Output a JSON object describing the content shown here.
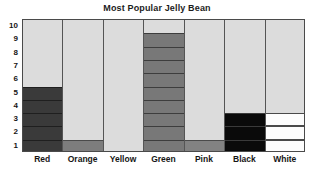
{
  "chart_data": {
    "type": "bar",
    "title": "Most Popular Jelly Bean",
    "xlabel": "",
    "ylabel": "",
    "categories": [
      "Red",
      "Orange",
      "Yellow",
      "Green",
      "Pink",
      "Black",
      "White"
    ],
    "values": [
      5,
      1,
      0,
      9,
      1,
      3,
      3
    ],
    "ylim": [
      0,
      10
    ],
    "yticks": [
      10,
      9,
      8,
      7,
      6,
      5,
      4,
      3,
      2,
      1
    ],
    "ytick_labels": [
      "10",
      "9",
      "8",
      "7",
      "6",
      "5",
      "4",
      "3",
      "2",
      "1"
    ],
    "grid": true,
    "legend": "none",
    "bar_style": "segmented-unit-cells",
    "series_colors": [
      "#3a3a3a",
      "#7d7d7d",
      "#dcdcdc",
      "#787878",
      "#828282",
      "#0a0a0a",
      "#fdfdfd"
    ],
    "plot_background": "#dcdcdc",
    "frame_color": "#4a4a4a",
    "title_color": "#1c1c1c",
    "bars": [
      {
        "category": "Red",
        "value": 5,
        "fill": "#3a3a3a",
        "segment_border": "#1f1f1f"
      },
      {
        "category": "Orange",
        "value": 1,
        "fill": "#7d7d7d",
        "segment_border": "#4a4a4a"
      },
      {
        "category": "Yellow",
        "value": 0,
        "fill": "#dcdcdc",
        "segment_border": "#c8c8c8"
      },
      {
        "category": "Green",
        "value": 9,
        "fill": "#787878",
        "segment_border": "#3d3d3d"
      },
      {
        "category": "Pink",
        "value": 1,
        "fill": "#828282",
        "segment_border": "#4a4a4a"
      },
      {
        "category": "Black",
        "value": 3,
        "fill": "#0a0a0a",
        "segment_border": "#3a3a3a"
      },
      {
        "category": "White",
        "value": 3,
        "fill": "#fdfdfd",
        "segment_border": "#4a4a4a"
      }
    ]
  }
}
